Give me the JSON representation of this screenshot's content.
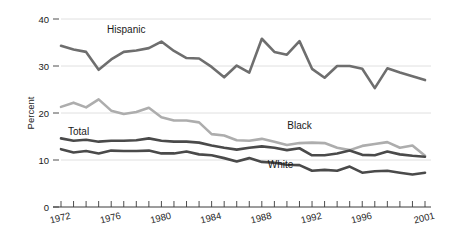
{
  "chart_data": {
    "type": "line",
    "title": "",
    "xlabel": "",
    "ylabel": "Percent",
    "ylim": [
      0,
      40
    ],
    "yticks": [
      0,
      10,
      20,
      30,
      40
    ],
    "xlim": [
      1972,
      2001
    ],
    "xticks_labeled": [
      "1972",
      "1976",
      "1980",
      "1984",
      "1988",
      "1992",
      "1996",
      "2001"
    ],
    "xtick_label_years": [
      1972,
      1976,
      1980,
      1984,
      1988,
      1992,
      1996,
      2001
    ],
    "x_minor_tick_every": 1,
    "grid": "horizontal",
    "legend": "inline-annotations",
    "x": [
      1972,
      1973,
      1974,
      1975,
      1976,
      1977,
      1978,
      1979,
      1980,
      1981,
      1982,
      1983,
      1984,
      1985,
      1986,
      1987,
      1988,
      1989,
      1990,
      1991,
      1992,
      1993,
      1994,
      1995,
      1996,
      1997,
      1998,
      1999,
      2000,
      2001
    ],
    "series": [
      {
        "name": "Hispanic",
        "color": "#6e6e6e",
        "width": 2.6,
        "label_x": 1977.2,
        "label_y": 37.0,
        "values": [
          34.3,
          33.5,
          33.0,
          29.2,
          31.4,
          33.0,
          33.3,
          33.8,
          35.2,
          33.2,
          31.7,
          31.6,
          29.8,
          27.6,
          30.1,
          28.6,
          35.8,
          33.0,
          32.4,
          35.3,
          29.4,
          27.5,
          30.0,
          30.0,
          29.4,
          25.3,
          29.5,
          28.6,
          27.8,
          27.0
        ]
      },
      {
        "name": "Black",
        "color": "#adadad",
        "width": 2.6,
        "label_x": 1991.0,
        "label_y": 16.7,
        "values": [
          21.3,
          22.2,
          21.2,
          22.9,
          20.5,
          19.8,
          20.2,
          21.1,
          19.1,
          18.4,
          18.4,
          18.0,
          15.5,
          15.2,
          14.2,
          14.1,
          14.5,
          13.9,
          13.2,
          13.6,
          13.7,
          13.6,
          12.6,
          12.1,
          13.0,
          13.4,
          13.8,
          12.6,
          13.1,
          10.9
        ]
      },
      {
        "name": "Total",
        "color": "#4a4a4a",
        "width": 2.6,
        "label_x": 1973.4,
        "label_y": 15.4,
        "values": [
          14.6,
          14.1,
          14.3,
          13.9,
          14.1,
          14.1,
          14.2,
          14.6,
          14.1,
          13.9,
          13.9,
          13.7,
          13.1,
          12.6,
          12.2,
          12.6,
          12.9,
          12.6,
          12.1,
          12.5,
          11.0,
          11.0,
          11.4,
          12.0,
          11.1,
          11.0,
          11.8,
          11.2,
          10.9,
          10.7
        ]
      },
      {
        "name": "White",
        "color": "#4a4a4a",
        "width": 2.6,
        "label_x": 1989.5,
        "label_y": 8.4,
        "values": [
          12.3,
          11.6,
          11.9,
          11.4,
          12.0,
          11.9,
          11.9,
          12.0,
          11.4,
          11.4,
          11.8,
          11.2,
          11.0,
          10.4,
          9.7,
          10.4,
          9.6,
          9.4,
          9.0,
          8.9,
          7.7,
          7.9,
          7.7,
          8.6,
          7.3,
          7.6,
          7.7,
          7.3,
          6.9,
          7.3
        ]
      }
    ]
  }
}
